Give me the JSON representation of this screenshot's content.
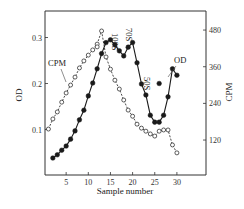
{
  "chart_data": {
    "type": "line",
    "title": "",
    "xlabel": "Sample number",
    "ylabel_left": "OD",
    "ylabel_right": "CPM",
    "xlim": [
      0,
      35
    ],
    "ylim_left": [
      0,
      0.355
    ],
    "ylim_right": [
      0,
      580
    ],
    "x_ticks": [
      5,
      10,
      15,
      20,
      25,
      30
    ],
    "y_left_ticks": [
      0.1,
      0.2,
      0.3
    ],
    "y_right_ticks": [
      120,
      240,
      360,
      480
    ],
    "grid": false,
    "legend": "inline labels (CPM, OD)",
    "series": [
      {
        "name": "OD",
        "axis": "left",
        "marker": "filled-circle",
        "line": "solid",
        "x": [
          2,
          3,
          4,
          5,
          6,
          7,
          8,
          9,
          10,
          11,
          12,
          13,
          14,
          15,
          16,
          17,
          18,
          19,
          20,
          21,
          22,
          23,
          24,
          25,
          26,
          27,
          28,
          29,
          30
        ],
        "values": [
          0.038,
          0.045,
          0.055,
          0.064,
          0.079,
          0.097,
          0.121,
          0.142,
          0.173,
          0.201,
          0.232,
          0.265,
          0.289,
          0.295,
          0.284,
          0.271,
          0.26,
          0.279,
          0.289,
          0.245,
          0.199,
          0.175,
          0.131,
          0.116,
          0.116,
          0.131,
          0.171,
          0.232,
          0.218
        ]
      },
      {
        "name": "OD outlier",
        "axis": "left",
        "marker": "filled-circle",
        "line": "none",
        "x": [
          26
        ],
        "values": [
          0.2
        ]
      },
      {
        "name": "CPM",
        "axis": "right",
        "marker": "open-circle",
        "line": "dashed",
        "x": [
          1,
          2,
          3,
          4,
          5,
          6,
          7,
          8,
          9,
          10,
          11,
          12,
          13,
          14,
          15,
          16,
          17,
          18,
          19,
          20,
          21,
          22,
          23,
          24,
          25,
          26,
          27,
          28,
          29,
          30
        ],
        "values": [
          156,
          189,
          212,
          244,
          274,
          300,
          326,
          356,
          379,
          398,
          415,
          434,
          477,
          392,
          352,
          316,
          287,
          251,
          218,
          198,
          172,
          159,
          149,
          140,
          133,
          149,
          153,
          153,
          104,
          78
        ]
      },
      {
        "name": "CPM outlier",
        "axis": "right",
        "marker": "open-circle",
        "line": "none",
        "x": [
          12
        ],
        "values": [
          425
        ]
      }
    ],
    "annotations": [
      {
        "text": "100S",
        "x": 15,
        "rotated": true
      },
      {
        "text": "70S",
        "x": 19,
        "rotated": true
      },
      {
        "text": "50S",
        "x": 23,
        "rotated": true
      },
      {
        "text": "CPM",
        "label_for": "CPM"
      },
      {
        "text": "OD",
        "label_for": "OD"
      }
    ]
  },
  "labels": {
    "xlabel": "Sample number",
    "ylabel_left": "OD",
    "ylabel_right": "CPM",
    "ann_100s": "100S",
    "ann_70s": "70S",
    "ann_50s": "50S",
    "ann_cpm": "CPM",
    "ann_od": "OD"
  },
  "colors": {
    "ink": "#1a1a1a",
    "background": "#ffffff"
  }
}
